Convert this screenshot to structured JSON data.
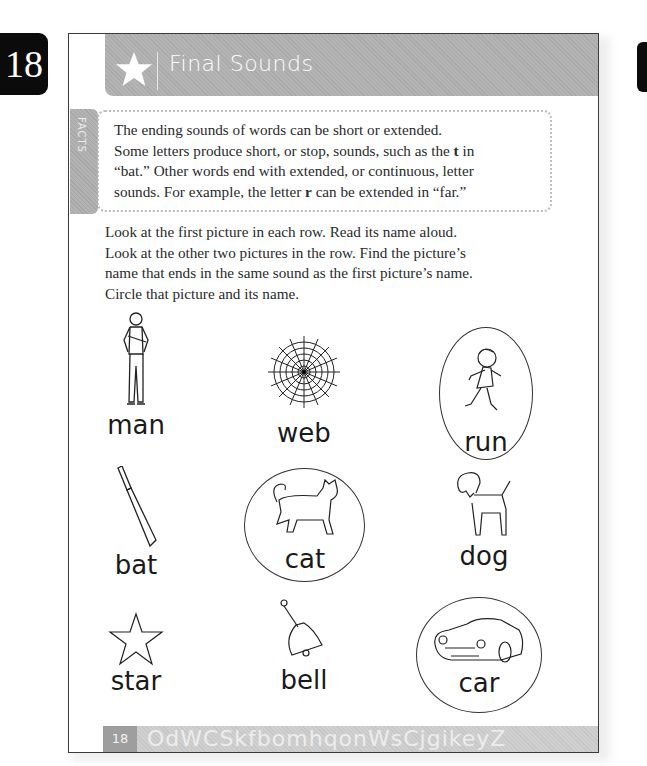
{
  "page_tab": {
    "number": "18"
  },
  "banner": {
    "icon": "star-icon",
    "title": "Final Sounds"
  },
  "facts": {
    "tab_label": "FACTS",
    "lines": [
      "The ending sounds of words can be short or extended.",
      "Some letters produce short, or stop, sounds, such as the ",
      "t",
      " in",
      "“bat.” Other words end with extended, or continuous, letter",
      "sounds. For example, the letter ",
      "r",
      " can be extended in “far.”"
    ]
  },
  "instructions": {
    "lines": [
      "Look at the first picture in each row. Read its name aloud.",
      "Look at the other two pictures in the row. Find the picture’s",
      "name that ends in the same sound as the first picture’s name.",
      "Circle that picture and its name."
    ]
  },
  "rows": [
    {
      "items": [
        {
          "word": "man",
          "picture": "man-icon",
          "circled": false
        },
        {
          "word": "web",
          "picture": "spider-web-icon",
          "circled": false
        },
        {
          "word": "run",
          "picture": "running-child-icon",
          "circled": true
        }
      ]
    },
    {
      "items": [
        {
          "word": "bat",
          "picture": "cricket-bat-icon",
          "circled": false
        },
        {
          "word": "cat",
          "picture": "cat-icon",
          "circled": true
        },
        {
          "word": "dog",
          "picture": "dog-icon",
          "circled": false
        }
      ]
    },
    {
      "items": [
        {
          "word": "star",
          "picture": "star-outline-icon",
          "circled": false
        },
        {
          "word": "bell",
          "picture": "bell-icon",
          "circled": false
        },
        {
          "word": "car",
          "picture": "car-icon",
          "circled": true
        }
      ]
    }
  ],
  "footer": {
    "page_number": "18",
    "decorative_letters": "OdWCSkfbomhqonWsCjgikeyZ"
  }
}
